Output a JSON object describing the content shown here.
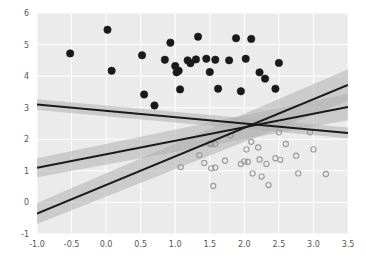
{
  "chart_data": {
    "type": "scatter",
    "title": "",
    "xlabel": "",
    "ylabel": "",
    "xlim": [
      -1.0,
      3.5
    ],
    "ylim": [
      -1,
      6
    ],
    "grid": true,
    "grid_color": "#ffffff",
    "plot_background": "#ebebeb",
    "legend": "none",
    "xticks": [
      -1.0,
      -0.5,
      0.0,
      0.5,
      1.0,
      1.5,
      2.0,
      2.5,
      3.0,
      3.5
    ],
    "xticklabels": [
      "-1.0",
      "-0.5",
      "0.0",
      "0.5",
      "1.0",
      "1.5",
      "2.0",
      "2.5",
      "3.0",
      "3.5"
    ],
    "yticks": [
      -1,
      0,
      1,
      2,
      3,
      4,
      5,
      6
    ],
    "yticklabels": [
      "-1",
      "0",
      "1",
      "2",
      "3",
      "4",
      "5",
      "6"
    ],
    "series": [
      {
        "name": "group-filled",
        "marker": "filled-circle",
        "color": "#1a1a1a",
        "edge_color": "#1a1a1a",
        "size": 5,
        "points": [
          [
            -0.52,
            4.72
          ],
          [
            0.02,
            5.47
          ],
          [
            0.08,
            4.17
          ],
          [
            0.52,
            4.66
          ],
          [
            0.55,
            3.42
          ],
          [
            0.7,
            3.07
          ],
          [
            0.85,
            4.52
          ],
          [
            0.93,
            5.06
          ],
          [
            1.0,
            4.32
          ],
          [
            1.02,
            4.12
          ],
          [
            1.05,
            4.17
          ],
          [
            1.07,
            3.58
          ],
          [
            1.18,
            4.5
          ],
          [
            1.22,
            4.41
          ],
          [
            1.3,
            4.53
          ],
          [
            1.33,
            5.25
          ],
          [
            1.45,
            4.55
          ],
          [
            1.5,
            4.13
          ],
          [
            1.58,
            4.52
          ],
          [
            1.62,
            3.6
          ],
          [
            1.78,
            4.5
          ],
          [
            1.88,
            5.2
          ],
          [
            1.95,
            3.52
          ],
          [
            2.02,
            4.55
          ],
          [
            2.1,
            5.18
          ],
          [
            2.22,
            4.12
          ],
          [
            2.3,
            3.92
          ],
          [
            2.45,
            3.6
          ],
          [
            2.5,
            4.42
          ]
        ]
      },
      {
        "name": "group-open",
        "marker": "open-circle",
        "color": "#b7b7b7",
        "edge_color": "#9a9a9a",
        "size": 4,
        "points": [
          [
            1.08,
            1.12
          ],
          [
            1.35,
            1.5
          ],
          [
            1.5,
            1.86
          ],
          [
            1.52,
            1.84
          ],
          [
            1.58,
            1.85
          ],
          [
            1.42,
            1.25
          ],
          [
            1.52,
            1.08
          ],
          [
            1.58,
            1.1
          ],
          [
            1.55,
            0.52
          ],
          [
            1.8,
            2.12
          ],
          [
            1.72,
            1.32
          ],
          [
            1.95,
            1.22
          ],
          [
            2.0,
            1.3
          ],
          [
            2.05,
            1.28
          ],
          [
            2.03,
            1.68
          ],
          [
            2.1,
            1.92
          ],
          [
            2.12,
            0.92
          ],
          [
            2.2,
            1.74
          ],
          [
            2.22,
            1.36
          ],
          [
            2.25,
            0.82
          ],
          [
            2.32,
            1.22
          ],
          [
            2.35,
            0.55
          ],
          [
            2.45,
            1.4
          ],
          [
            2.52,
            1.35
          ],
          [
            2.5,
            2.22
          ],
          [
            2.6,
            1.85
          ],
          [
            2.75,
            1.48
          ],
          [
            2.78,
            0.92
          ],
          [
            2.95,
            2.22
          ],
          [
            3.0,
            1.68
          ],
          [
            3.18,
            0.9
          ]
        ]
      }
    ],
    "fitted_lines": [
      {
        "name": "line-negative-slope",
        "color": "#1a1a1a",
        "width": 2,
        "band_color": "#b0b0b0",
        "band_opacity": 0.55,
        "x_start": -1.0,
        "y_start": 3.1,
        "x_end": 3.5,
        "y_end": 2.2,
        "band_half_width_start": 0.17,
        "band_half_width_end": 0.17
      },
      {
        "name": "line-middle-slope",
        "color": "#1a1a1a",
        "width": 2,
        "band_color": "#b0b0b0",
        "band_opacity": 0.55,
        "x_start": -1.0,
        "y_start": 1.1,
        "x_end": 3.5,
        "y_end": 3.02,
        "band_half_width_start": 0.3,
        "band_half_width_end": 0.42
      },
      {
        "name": "line-steep-slope",
        "color": "#1a1a1a",
        "width": 2,
        "band_color": "#b0b0b0",
        "band_opacity": 0.55,
        "x_start": -1.0,
        "y_start": -0.35,
        "x_end": 3.5,
        "y_end": 3.72,
        "band_half_width_start": 0.33,
        "band_half_width_end": 0.5
      }
    ]
  }
}
